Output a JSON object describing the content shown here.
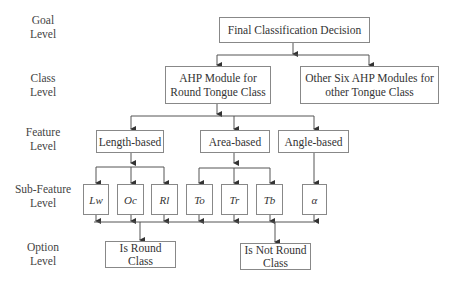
{
  "levels": {
    "goal": [
      "Goal",
      "Level"
    ],
    "class": [
      "Class",
      "Level"
    ],
    "feature": [
      "Feature",
      "Level"
    ],
    "subfeature": [
      "Sub-Feature",
      "Level"
    ],
    "option": [
      "Option",
      "Level"
    ]
  },
  "goal": {
    "label": "Final Classification Decision"
  },
  "classes": {
    "round": [
      "AHP Module for",
      "Round Tongue Class"
    ],
    "other": [
      "Other Six AHP Modules for",
      "other Tongue Class"
    ]
  },
  "features": {
    "length": "Length-based",
    "area": "Area-based",
    "angle": "Angle-based"
  },
  "subfeatures": {
    "lw": "Lw",
    "oc": "Oc",
    "rl": "Rl",
    "to": "To",
    "tr": "Tr",
    "tb": "Tb",
    "alpha": "α"
  },
  "options": {
    "round": [
      "Is Round",
      "Class"
    ],
    "not_round": [
      "Is Not Round",
      "Class"
    ]
  },
  "colors": {
    "line": "#444444",
    "box_border": "#888888",
    "text": "#333333"
  }
}
